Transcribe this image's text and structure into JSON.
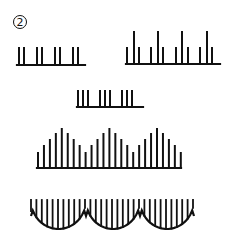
{
  "figure": {
    "label": "2",
    "stroke_color": "#111111",
    "background": "#ffffff"
  },
  "patterns": [
    {
      "name": "paired-ticks",
      "base_y": 65,
      "x_start": 17,
      "x_end": 85,
      "ticks": [
        {
          "x": 19,
          "top": 48
        },
        {
          "x": 24,
          "top": 48
        },
        {
          "x": 37,
          "top": 48
        },
        {
          "x": 42,
          "top": 48
        },
        {
          "x": 55,
          "top": 48
        },
        {
          "x": 60,
          "top": 48
        },
        {
          "x": 73,
          "top": 48
        },
        {
          "x": 78,
          "top": 48
        }
      ]
    },
    {
      "name": "alternating-tall-short-ticks",
      "base_y": 64,
      "x_start": 126,
      "x_end": 220,
      "ticks": [
        {
          "x": 127,
          "top": 48
        },
        {
          "x": 134,
          "top": 32
        },
        {
          "x": 139,
          "top": 48
        },
        {
          "x": 151,
          "top": 48
        },
        {
          "x": 158,
          "top": 32
        },
        {
          "x": 163,
          "top": 48
        },
        {
          "x": 176,
          "top": 48
        },
        {
          "x": 182,
          "top": 32
        },
        {
          "x": 188,
          "top": 48
        },
        {
          "x": 200,
          "top": 48
        },
        {
          "x": 207,
          "top": 32
        },
        {
          "x": 212,
          "top": 48
        }
      ]
    },
    {
      "name": "triple-ticks",
      "base_y": 107,
      "x_start": 77,
      "x_end": 143,
      "ticks": [
        {
          "x": 78,
          "top": 91
        },
        {
          "x": 83,
          "top": 91
        },
        {
          "x": 88,
          "top": 91
        },
        {
          "x": 100,
          "top": 91
        },
        {
          "x": 105,
          "top": 91
        },
        {
          "x": 110,
          "top": 91
        },
        {
          "x": 122,
          "top": 91
        },
        {
          "x": 127,
          "top": 91
        },
        {
          "x": 132,
          "top": 91
        }
      ]
    },
    {
      "name": "triple-peak-ticks",
      "base_y": 168,
      "x_start": 37,
      "x_end": 181,
      "tick_x_start": 38,
      "tick_spacing": 5.95,
      "levels": [
        1,
        2,
        3,
        4,
        5,
        4,
        3,
        2,
        1,
        2,
        3,
        4,
        5,
        4,
        3,
        2,
        1,
        2,
        3,
        4,
        5,
        4,
        3,
        2,
        1
      ],
      "level_top": {
        "1": 153,
        "2": 146,
        "3": 140,
        "4": 134,
        "5": 129
      }
    },
    {
      "name": "scalloped-hanging-lines",
      "top_y": 200,
      "x_start": 31,
      "x_end": 194,
      "arcs": [
        {
          "x1": 31,
          "x2": 86,
          "bottom": 229
        },
        {
          "x1": 86,
          "x2": 140,
          "bottom": 229
        },
        {
          "x1": 140,
          "x2": 194,
          "bottom": 229
        }
      ],
      "edge_y": 211,
      "junction_y": 216,
      "line_spacing": 5.4
    }
  ]
}
